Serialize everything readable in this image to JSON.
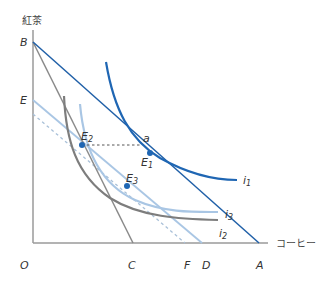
{
  "diagram": {
    "y_axis_label": "紅茶",
    "x_axis_label": "コーヒー",
    "origin_label": "O",
    "axis_points": {
      "B": "B",
      "E": "E",
      "C": "C",
      "F": "F",
      "D": "D",
      "A": "A"
    },
    "points": {
      "a": "a",
      "E1": "E",
      "E1_sub": "1",
      "E2": "E",
      "E2_sub": "2",
      "E3": "E",
      "E3_sub": "3"
    },
    "curves": {
      "i1": "i",
      "i1_sub": "1",
      "i2": "i",
      "i2_sub": "2",
      "i3": "i",
      "i3_sub": "3"
    },
    "colors": {
      "axis": "#9a9a9a",
      "budget_BA": "#2060a8",
      "budget_BC": "#8a8a8a",
      "budget_ED": "#a9c6e4",
      "budget_dashed": "#a9c0d8",
      "indiff_i1": "#1f66b3",
      "indiff_i2": "#7d7d7d",
      "indiff_i3": "#a9c6e4",
      "point": "#1f66b3"
    }
  }
}
